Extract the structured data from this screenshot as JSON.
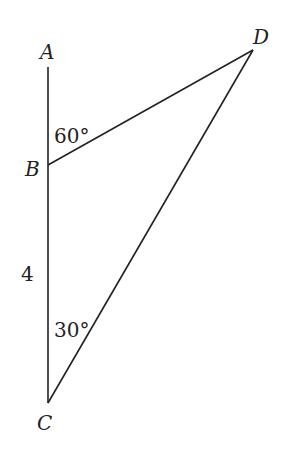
{
  "diagram": {
    "points": {
      "A": {
        "label": "A",
        "x": 48,
        "y": 67
      },
      "B": {
        "label": "B",
        "x": 48,
        "y": 165
      },
      "C": {
        "label": "C",
        "x": 48,
        "y": 403
      },
      "D": {
        "label": "D",
        "x": 253,
        "y": 50
      }
    },
    "segments": [
      [
        "A",
        "C"
      ],
      [
        "B",
        "D"
      ],
      [
        "C",
        "D"
      ]
    ],
    "angles": {
      "at_B": "60°",
      "at_C": "30°"
    },
    "lengths": {
      "BC": "4"
    },
    "line_color": "#222222"
  }
}
